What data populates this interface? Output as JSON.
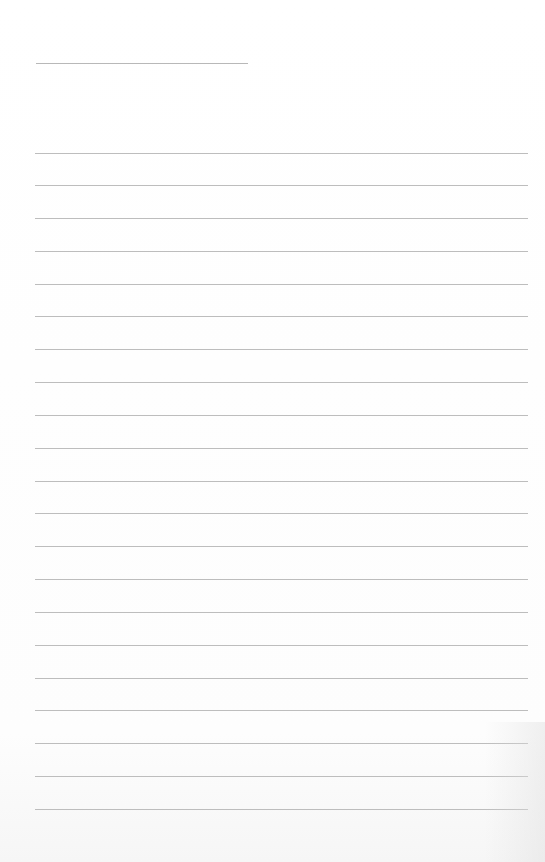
{
  "page": {
    "type": "blank lined notebook page",
    "background_color": "#ffffff",
    "line_color": "#bdbdbd",
    "title_line": {
      "present": true,
      "text": ""
    },
    "rule_count": 21,
    "rules": [
      {
        "y": 153,
        "text": ""
      },
      {
        "y": 185,
        "text": ""
      },
      {
        "y": 218,
        "text": ""
      },
      {
        "y": 251,
        "text": ""
      },
      {
        "y": 284,
        "text": ""
      },
      {
        "y": 316,
        "text": ""
      },
      {
        "y": 349,
        "text": ""
      },
      {
        "y": 382,
        "text": ""
      },
      {
        "y": 415,
        "text": ""
      },
      {
        "y": 448,
        "text": ""
      },
      {
        "y": 481,
        "text": ""
      },
      {
        "y": 513,
        "text": ""
      },
      {
        "y": 546,
        "text": ""
      },
      {
        "y": 579,
        "text": ""
      },
      {
        "y": 612,
        "text": ""
      },
      {
        "y": 645,
        "text": ""
      },
      {
        "y": 678,
        "text": ""
      },
      {
        "y": 710,
        "text": ""
      },
      {
        "y": 743,
        "text": ""
      },
      {
        "y": 776,
        "text": ""
      },
      {
        "y": 809,
        "text": ""
      }
    ]
  }
}
